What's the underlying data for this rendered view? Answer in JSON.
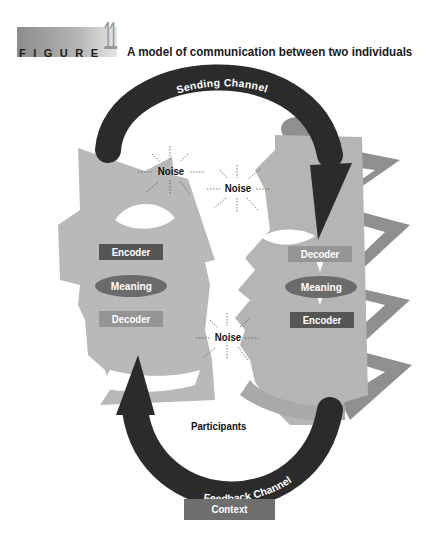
{
  "header": {
    "figure_word": "FIGURE",
    "figure_number": "11",
    "title": "A model of communication between two individuals"
  },
  "diagram": {
    "channels": {
      "sending": "Sending Channel",
      "feedback": "Feedback Channel"
    },
    "left_person": {
      "encoder": "Encoder",
      "meaning": "Meaning",
      "decoder": "Decoder"
    },
    "right_person": {
      "decoder": "Decoder",
      "meaning": "Meaning",
      "encoder": "Encoder"
    },
    "noise": [
      "Noise",
      "Noise",
      "Noise"
    ],
    "participants": "Participants",
    "context": "Context"
  },
  "colors": {
    "head_light": "#b9b9b9",
    "head_mid": "#a8a8a8",
    "zigzag": "#8f8f8f",
    "arrow": "#2b2b2b",
    "encoder_box": "#555555",
    "decoder_box": "#959595",
    "meaning_oval": "#6b6b6b",
    "context_box": "#6e6e6e"
  }
}
